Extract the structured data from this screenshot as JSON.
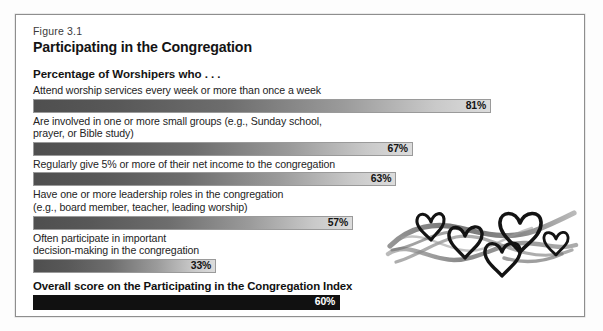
{
  "figure": {
    "number": "Figure 3.1",
    "title": "Participating in the Congregation",
    "section_heading": "Percentage of Worshipers who . . ."
  },
  "chart_data": {
    "type": "bar",
    "title": "Participating in the Congregation",
    "subtitle": "Percentage of Worshipers who . . .",
    "xlabel": "",
    "ylabel": "",
    "xlim": [
      0,
      100
    ],
    "grid": false,
    "legend": "none",
    "orientation": "horizontal",
    "value_suffix": "%",
    "categories": [
      "Attend worship services every week or more than once a week",
      "Are involved in one or more small groups (e.g., Sunday school,\nprayer, or Bible study)",
      "Regularly give 5% or more of their net income to the congregation",
      "Have one or more leadership roles in the congregation\n(e.g., board member, teacher, leading worship)",
      "Often participate in important\ndecision-making in the congregation"
    ],
    "values": [
      81,
      67,
      63,
      57,
      33
    ],
    "value_labels": [
      "81%",
      "67%",
      "63%",
      "57%",
      "33%"
    ],
    "summary": {
      "label": "Overall score on the Participating in the Congregation Index",
      "value": 60,
      "value_label": "60%"
    }
  },
  "bars": [
    {
      "label": "Attend worship services every week or more than once a week",
      "value": 81,
      "value_label": "81%",
      "width_pct": 85.0
    },
    {
      "label": "Are involved in one or more small groups (e.g., Sunday school,\nprayer, or Bible study)",
      "value": 67,
      "value_label": "67%",
      "width_pct": 70.5
    },
    {
      "label": "Regularly give 5% or more of their net income to the congregation",
      "value": 63,
      "value_label": "63%",
      "width_pct": 67.4
    },
    {
      "label": "Have one or more leadership roles in the congregation\n(e.g., board member, teacher, leading worship)",
      "value": 57,
      "value_label": "57%",
      "width_pct": 59.4
    },
    {
      "label": "Often participate in important\ndecision-making in the congregation",
      "value": 33,
      "value_label": "33%",
      "width_pct": 34.0
    }
  ],
  "summary_bar": {
    "label": "Overall score on the Participating in the Congregation Index",
    "value": 60,
    "value_label": "60%",
    "width_pct": 57.0
  },
  "artwork": {
    "name": "hearts-brushstroke-illustration",
    "description": "hand-drawn hearts over brush strokes",
    "heart_count": 5
  },
  "colors": {
    "bar_dark": "#4f4f4f",
    "bar_light": "#dcdcdc",
    "bar_border": "#9a9a9a",
    "summary_fill": "#111111",
    "summary_text": "#ffffff",
    "frame_border": "#8e8e8e",
    "text": "#141414",
    "page_background": "#ffffff"
  }
}
